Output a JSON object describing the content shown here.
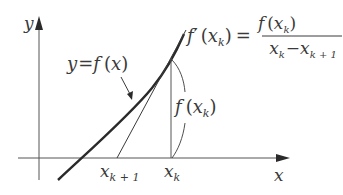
{
  "diagram": {
    "axes": {
      "x_label": "x",
      "y_label": "y"
    },
    "curve_label": {
      "y": "y",
      "eq": "=",
      "f": "f",
      "open": "(",
      "x": "x",
      "close": ")"
    },
    "formula": {
      "lhs_f": "f",
      "prime": "′",
      "lhs_open": "(",
      "lhs_x": "x",
      "lhs_sub": "k",
      "lhs_close": ")",
      "eq": "=",
      "num_f": "f",
      "num_open": "(",
      "num_x": "x",
      "num_sub": "k",
      "num_close": ")",
      "den_x1": "x",
      "den_sub1": "k",
      "minus": "−",
      "den_x2": "x",
      "den_sub2": "k + 1"
    },
    "height_label": {
      "f": "f",
      "open": "(",
      "x": "x",
      "sub": "k",
      "close": ")"
    },
    "ticks": [
      {
        "x": "x",
        "sub": "k + 1"
      },
      {
        "x": "x",
        "sub": "k"
      }
    ],
    "colors": {
      "line": "#3a3a3a",
      "curve": "#2a2a2a"
    }
  }
}
